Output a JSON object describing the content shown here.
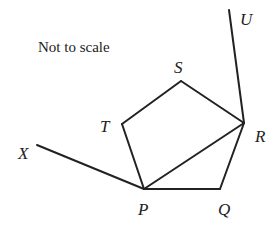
{
  "diagram": {
    "note": "Not to scale",
    "stroke_color": "#222222",
    "background": "#ffffff",
    "points": {
      "S": {
        "label": "S",
        "x": 181,
        "y": 81,
        "lx": 174,
        "ly": 73
      },
      "T": {
        "label": "T",
        "x": 122,
        "y": 124,
        "lx": 100,
        "ly": 132
      },
      "P": {
        "label": "P",
        "x": 144,
        "y": 189,
        "lx": 138,
        "ly": 215
      },
      "Q": {
        "label": "Q",
        "x": 220,
        "y": 189,
        "lx": 218,
        "ly": 215
      },
      "R": {
        "label": "R",
        "x": 244,
        "y": 123,
        "lx": 255,
        "ly": 142
      },
      "U": {
        "label": "U",
        "x": 229,
        "y": 10,
        "lx": 240,
        "ly": 25
      },
      "X": {
        "label": "X",
        "x": 37,
        "y": 145,
        "lx": 18,
        "ly": 159
      }
    },
    "segments": [
      [
        "P",
        "T"
      ],
      [
        "T",
        "S"
      ],
      [
        "S",
        "R"
      ],
      [
        "R",
        "Q"
      ],
      [
        "Q",
        "P"
      ],
      [
        "P",
        "R"
      ],
      [
        "R",
        "U"
      ],
      [
        "P",
        "X"
      ]
    ]
  }
}
